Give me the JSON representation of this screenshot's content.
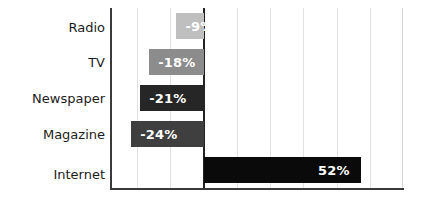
{
  "chart_data": {
    "type": "bar",
    "orientation": "horizontal",
    "title": "",
    "subtitle": "",
    "xlabel": "",
    "ylabel": "",
    "categories": [
      "Radio",
      "TV",
      "Newspaper",
      "Magazine",
      "Internet"
    ],
    "values": [
      -9,
      -18,
      -21,
      -24,
      52
    ],
    "value_labels": [
      "-9%",
      "-18%",
      "-21%",
      "-24%",
      "52%"
    ],
    "bar_colors": [
      "#bfbfbf",
      "#8c8c8c",
      "#262626",
      "#3f3f3f",
      "#0a0a0a"
    ],
    "value_label_color": "#ffffff",
    "xlim": [
      -31,
      66
    ],
    "xticks": [
      -22,
      -11,
      0,
      11,
      22,
      33,
      44,
      55
    ],
    "xtick_labels": [],
    "grid": true,
    "grid_color": "#e2e2e2",
    "legend": null,
    "zero_line": 0,
    "zero_line_color": "#222222",
    "axis_color": "#3a3a3a",
    "background_color": "#ffffff",
    "units": "percent"
  }
}
